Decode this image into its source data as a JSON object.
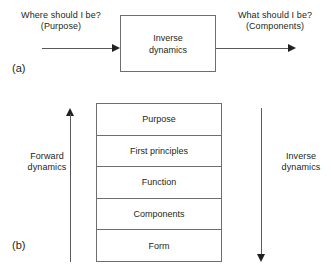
{
  "figure": {
    "caption_a": "(a)",
    "caption_b": "(b)",
    "line_color": "#6d6e71",
    "arrow_color": "#231f20",
    "text_color": "#231f20",
    "background": "#ffffff"
  },
  "panel_a": {
    "label": "(a)",
    "input_label": "Where should I be?\n(Purpose)",
    "output_label": "What should I be?\n(Components)",
    "process_box": "Inverse\ndynamics",
    "input_arrow_name": "input-arrow",
    "output_arrow_name": "output-arrow"
  },
  "panel_b": {
    "label": "(b)",
    "left_arrow_label": "Forward\ndynamics",
    "right_arrow_label": "Inverse\ndynamics",
    "left_arrow_direction": "up",
    "right_arrow_direction": "down",
    "stack": [
      {
        "label": "Purpose"
      },
      {
        "label": "First principles"
      },
      {
        "label": "Function"
      },
      {
        "label": "Components"
      },
      {
        "label": "Form"
      }
    ]
  }
}
